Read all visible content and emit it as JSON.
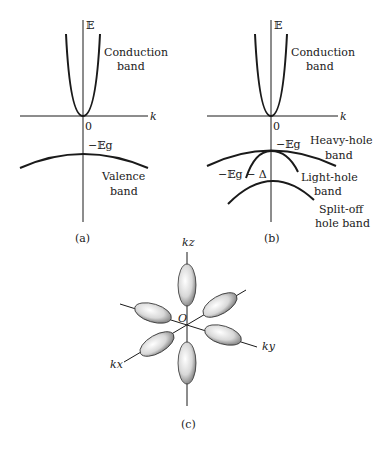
{
  "panel_a": {
    "axis_energy": "𝔼",
    "axis_k": "k",
    "origin": "0",
    "gap_label": "−𝔼g",
    "conduction_line1": "Conduction",
    "conduction_line2": "band",
    "valence_line1": "Valence",
    "valence_line2": "band",
    "caption": "(a)"
  },
  "panel_b": {
    "axis_energy": "𝔼",
    "axis_k": "k",
    "origin": "0",
    "gap_label": "−𝔼g",
    "splitoff_energy_label": "−𝔼g − Δ",
    "conduction_line1": "Conduction",
    "conduction_line2": "band",
    "heavy_line1": "Heavy-hole",
    "heavy_line2": "band",
    "light_line1": "Light-hole",
    "light_line2": "band",
    "splitoff_line1": "Split-off",
    "splitoff_line2": "hole band",
    "caption": "(b)"
  },
  "panel_c": {
    "axis_kz": "kz",
    "axis_ky": "ky",
    "axis_kx": "kx",
    "origin": "O",
    "caption": "(c)"
  },
  "colors": {
    "ink": "#1a1a1a",
    "background": "#ffffff"
  }
}
